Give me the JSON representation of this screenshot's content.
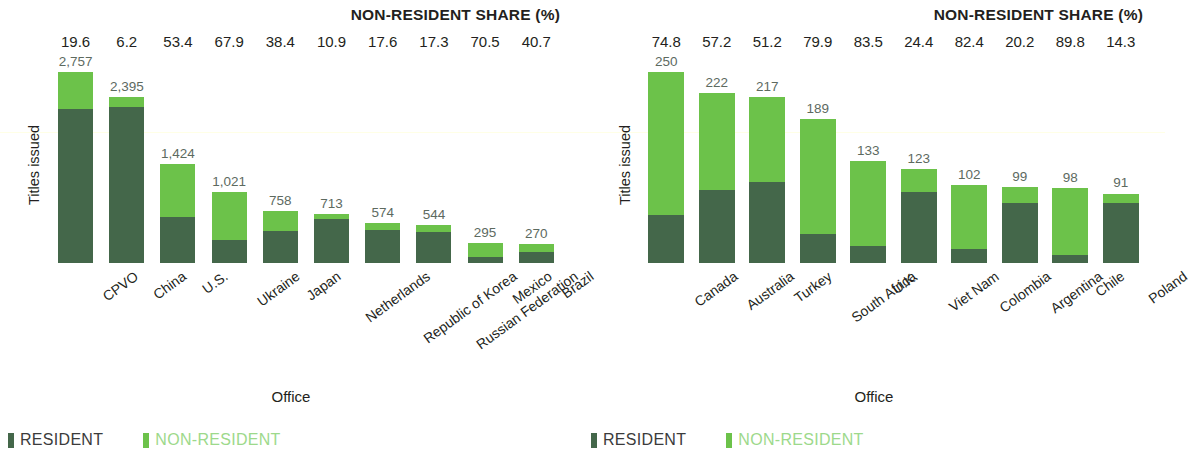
{
  "chart_data": [
    {
      "type": "bar",
      "stacked": true,
      "title": "NON-RESIDENT SHARE (%)",
      "xlabel": "Office",
      "ylabel": "Titles issued",
      "ylim": [
        0,
        2757
      ],
      "grid": false,
      "legend_position": "bottom-left",
      "categories": [
        "CPVO",
        "China",
        "U.S.",
        "Ukraine",
        "Japan",
        "Netherlands",
        "Republic of Korea",
        "Russian Federation",
        "Mexico",
        "Brazil"
      ],
      "totals": [
        2757,
        2395,
        1424,
        1021,
        758,
        713,
        574,
        544,
        295,
        270
      ],
      "total_labels": [
        "2,757",
        "2,395",
        "1,424",
        "1,021",
        "758",
        "713",
        "574",
        "544",
        "295",
        "270"
      ],
      "non_resident_share_pct": [
        19.6,
        6.2,
        53.4,
        67.9,
        38.4,
        10.9,
        17.6,
        17.3,
        70.5,
        40.7
      ],
      "share_labels": [
        "19.6",
        "6.2",
        "53.4",
        "67.9",
        "38.4",
        "10.9",
        "17.6",
        "17.3",
        "70.5",
        "40.7"
      ],
      "series": [
        {
          "name": "RESIDENT",
          "color": "#44674a",
          "values": [
            2217,
            2247,
            664,
            328,
            467,
            635,
            473,
            450,
            87,
            160
          ]
        },
        {
          "name": "NON-RESIDENT",
          "color": "#6cc24a",
          "values": [
            540,
            148,
            760,
            693,
            291,
            78,
            101,
            94,
            208,
            110
          ]
        }
      ]
    },
    {
      "type": "bar",
      "stacked": true,
      "title": "NON-RESIDENT SHARE (%)",
      "xlabel": "Office",
      "ylabel": "Titles issued",
      "ylim": [
        0,
        250
      ],
      "grid": false,
      "legend_position": "bottom-left",
      "categories": [
        "Canada",
        "Australia",
        "Turkey",
        "South Africa",
        "U.K.",
        "Viet Nam",
        "Colombia",
        "Argentina",
        "Chile",
        "Poland"
      ],
      "totals": [
        250,
        222,
        217,
        189,
        133,
        123,
        102,
        99,
        98,
        91
      ],
      "total_labels": [
        "250",
        "222",
        "217",
        "189",
        "133",
        "123",
        "102",
        "99",
        "98",
        "91"
      ],
      "non_resident_share_pct": [
        74.8,
        57.2,
        51.2,
        79.9,
        83.5,
        24.4,
        82.4,
        20.2,
        89.8,
        14.3
      ],
      "share_labels": [
        "74.8",
        "57.2",
        "51.2",
        "79.9",
        "83.5",
        "24.4",
        "82.4",
        "20.2",
        "89.8",
        "14.3"
      ],
      "series": [
        {
          "name": "RESIDENT",
          "color": "#44674a",
          "values": [
            63,
            95,
            106,
            38,
            22,
            93,
            18,
            79,
            10,
            78
          ]
        },
        {
          "name": "NON-RESIDENT",
          "color": "#6cc24a",
          "values": [
            187,
            127,
            111,
            151,
            111,
            30,
            84,
            20,
            88,
            13
          ]
        }
      ]
    }
  ],
  "legend": {
    "resident_label": "RESIDENT",
    "nonresident_label": "NON-RESIDENT",
    "resident_color": "#44674a",
    "nonresident_color": "#6cc24a"
  }
}
